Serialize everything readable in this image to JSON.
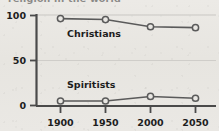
{
  "figure": {
    "title_clipped": "religion in the world",
    "background_color": "#e9e7e3",
    "ink_color": "#4a4a4a",
    "text_color": "#1d1d1d"
  },
  "chart_data": {
    "type": "line",
    "title": "",
    "xlabel": "",
    "ylabel": "",
    "categories": [
      "1900",
      "1950",
      "2000",
      "2050"
    ],
    "x": [
      1900,
      1950,
      2000,
      2050
    ],
    "xlim": [
      1880,
      2070
    ],
    "ylim": [
      0,
      100
    ],
    "yticks": [
      0,
      50,
      100
    ],
    "ytick_labels": [
      "0",
      "50",
      "100"
    ],
    "xtick_labels": [
      "1900",
      "1950",
      "2000",
      "2050"
    ],
    "grid": "horizontal-faint",
    "legend_position": "inline-labels",
    "marker": "open-circle",
    "series": [
      {
        "name": "Christians",
        "label": "Christians",
        "values": [
          96,
          95,
          87,
          86
        ],
        "color": "#5a5a5a",
        "label_x": 1928,
        "label_y": 78
      },
      {
        "name": "Spiritists",
        "label": "Spiritists",
        "values": [
          5,
          5,
          10,
          8
        ],
        "color": "#5a5a5a",
        "label_x": 1928,
        "label_y": 22
      }
    ]
  }
}
